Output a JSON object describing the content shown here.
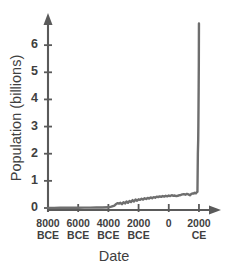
{
  "chart_data": {
    "type": "line",
    "title": "",
    "xlabel": "Date",
    "ylabel": "Population (billions)",
    "xlim": [
      -8000,
      2400
    ],
    "ylim": [
      0,
      7.0
    ],
    "grid": false,
    "legend": "none",
    "line_color": "#6e6e6e",
    "axis_color": "#5a5a5a",
    "x_tick_values": [
      -8000,
      -6000,
      -4000,
      -2000,
      0,
      2000
    ],
    "x_tick_labels": [
      {
        "top": "8000",
        "bottom": "BCE"
      },
      {
        "top": "6000",
        "bottom": "BCE"
      },
      {
        "top": "4000",
        "bottom": "BCE"
      },
      {
        "top": "2000",
        "bottom": "BCE"
      },
      {
        "top": "0",
        "bottom": ""
      },
      {
        "top": "2000",
        "bottom": "CE"
      }
    ],
    "y_tick_values": [
      0,
      1,
      2,
      3,
      4,
      5,
      6
    ],
    "y_tick_labels": [
      "0",
      "1",
      "2",
      "3",
      "4",
      "5",
      "6"
    ],
    "series": [
      {
        "name": "World population",
        "x": [
          -8000,
          -7600,
          -7200,
          -6800,
          -6400,
          -6000,
          -5600,
          -5200,
          -4800,
          -4400,
          -4000,
          -3800,
          -3600,
          -3500,
          -3400,
          -3300,
          -3200,
          -3100,
          -3000,
          -2900,
          -2800,
          -2700,
          -2600,
          -2500,
          -2400,
          -2300,
          -2200,
          -2100,
          -2000,
          -1900,
          -1800,
          -1700,
          -1600,
          -1500,
          -1400,
          -1300,
          -1200,
          -1100,
          -1000,
          -900,
          -800,
          -700,
          -600,
          -500,
          -400,
          -300,
          -200,
          -100,
          0,
          100,
          200,
          300,
          400,
          500,
          600,
          700,
          800,
          900,
          1000,
          1100,
          1200,
          1300,
          1400,
          1500,
          1600,
          1650,
          1700,
          1750,
          1800,
          1850,
          1900,
          1927,
          1950,
          1960,
          1970,
          1980,
          1990,
          1999
        ],
        "y": [
          0.005,
          0.006,
          0.007,
          0.008,
          0.009,
          0.01,
          0.012,
          0.014,
          0.017,
          0.02,
          0.025,
          0.05,
          0.09,
          0.14,
          0.18,
          0.16,
          0.19,
          0.14,
          0.21,
          0.17,
          0.24,
          0.19,
          0.26,
          0.22,
          0.29,
          0.24,
          0.31,
          0.27,
          0.32,
          0.3,
          0.34,
          0.31,
          0.36,
          0.33,
          0.37,
          0.35,
          0.39,
          0.36,
          0.4,
          0.38,
          0.42,
          0.4,
          0.43,
          0.41,
          0.44,
          0.42,
          0.45,
          0.43,
          0.46,
          0.44,
          0.47,
          0.45,
          0.46,
          0.44,
          0.45,
          0.47,
          0.48,
          0.5,
          0.51,
          0.49,
          0.52,
          0.5,
          0.47,
          0.52,
          0.54,
          0.53,
          0.56,
          0.55,
          0.54,
          0.58,
          0.6,
          2.0,
          2.52,
          3.02,
          3.7,
          4.43,
          5.27,
          6.8
        ]
      }
    ]
  }
}
